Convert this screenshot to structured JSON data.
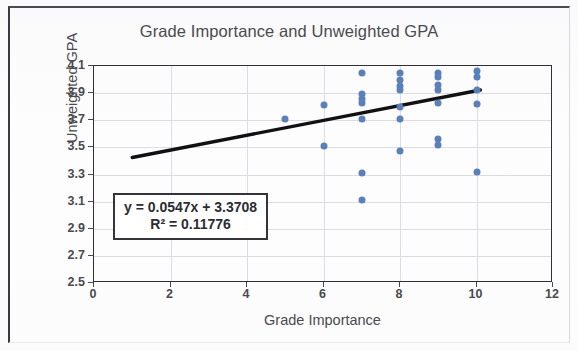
{
  "figure": {
    "title": "Grade Importance and Unweighted GPA",
    "xaxis_title": "Grade Importance",
    "yaxis_title": "Unweighted GPA",
    "equation_line1": "y = 0.0547x + 3.3708",
    "equation_line2": "R² = 0.11776",
    "point_color": "#5b7fb8",
    "trendline_color": "#111114",
    "grid_color": "#dcdce4",
    "axis_color": "#2f2f35"
  },
  "chart_data": {
    "type": "scatter",
    "title": "Grade Importance and Unweighted GPA",
    "xlabel": "Grade Importance",
    "ylabel": "Unweighted GPA",
    "xlim": [
      0,
      12
    ],
    "ylim": [
      2.5,
      4.1
    ],
    "xticks": [
      0,
      2,
      4,
      6,
      8,
      10,
      12
    ],
    "yticks": [
      2.5,
      2.7,
      2.9,
      3.1,
      3.3,
      3.5,
      3.7,
      3.9,
      4.1
    ],
    "xtick_labels": [
      "0",
      "2",
      "4",
      "6",
      "8",
      "10",
      "12"
    ],
    "ytick_labels": [
      "2.5",
      "2.7",
      "2.9",
      "3.1",
      "3.3",
      "3.5",
      "3.7",
      "3.9",
      "4.1"
    ],
    "grid": true,
    "legend": false,
    "points": [
      {
        "x": 5,
        "y": 3.71
      },
      {
        "x": 6,
        "y": 3.81
      },
      {
        "x": 6,
        "y": 3.51
      },
      {
        "x": 7,
        "y": 4.05
      },
      {
        "x": 7,
        "y": 3.89
      },
      {
        "x": 7,
        "y": 3.86
      },
      {
        "x": 7,
        "y": 3.83
      },
      {
        "x": 7,
        "y": 3.71
      },
      {
        "x": 7,
        "y": 3.31
      },
      {
        "x": 7,
        "y": 3.11
      },
      {
        "x": 8,
        "y": 4.05
      },
      {
        "x": 8,
        "y": 4.0
      },
      {
        "x": 8,
        "y": 3.95
      },
      {
        "x": 8,
        "y": 3.92
      },
      {
        "x": 8,
        "y": 3.8
      },
      {
        "x": 8,
        "y": 3.71
      },
      {
        "x": 8,
        "y": 3.47
      },
      {
        "x": 9,
        "y": 4.05
      },
      {
        "x": 9,
        "y": 4.02
      },
      {
        "x": 9,
        "y": 3.96
      },
      {
        "x": 9,
        "y": 3.92
      },
      {
        "x": 9,
        "y": 3.83
      },
      {
        "x": 9,
        "y": 3.56
      },
      {
        "x": 9,
        "y": 3.52
      },
      {
        "x": 10,
        "y": 4.06
      },
      {
        "x": 10,
        "y": 4.02
      },
      {
        "x": 10,
        "y": 3.92
      },
      {
        "x": 10,
        "y": 3.82
      },
      {
        "x": 10,
        "y": 3.32
      }
    ],
    "trendline": {
      "slope": 0.0547,
      "intercept": 3.3708,
      "r_squared": 0.11776,
      "x_start": 1,
      "x_end": 10.1,
      "equation_text": "y = 0.0547x + 3.3708",
      "r2_text": "R² = 0.11776"
    }
  }
}
